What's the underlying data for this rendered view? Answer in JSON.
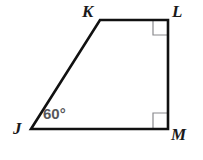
{
  "figure": {
    "kind": "quadrilateral-diagram",
    "shape_name": "JKLM",
    "background_color": "#ffffff",
    "stroke_color": "#111111",
    "stroke_width": 2.6,
    "right_angle_mark_color": "#8a8a8e",
    "right_angle_mark_width": 1.2,
    "angle_label_color": "#57575a",
    "vertex_label_color": "#1a1a1a",
    "vertices": [
      {
        "name": "J",
        "x": 31,
        "y": 129,
        "label": "J",
        "label_x": 13,
        "label_y": 120
      },
      {
        "name": "K",
        "x": 100,
        "y": 20,
        "label": "K",
        "label_x": 82,
        "label_y": 3
      },
      {
        "name": "L",
        "x": 168,
        "y": 20,
        "label": "L",
        "label_x": 172,
        "label_y": 3
      },
      {
        "name": "M",
        "x": 168,
        "y": 129,
        "label": "M",
        "label_x": 171,
        "label_y": 126
      }
    ],
    "edges": [
      {
        "name": "JK",
        "from": "J",
        "to": "K"
      },
      {
        "name": "KL",
        "from": "K",
        "to": "L"
      },
      {
        "name": "LM",
        "from": "L",
        "to": "M"
      },
      {
        "name": "MJ",
        "from": "M",
        "to": "J"
      }
    ],
    "angle_labels": [
      {
        "at_vertex": "J",
        "text": "60°",
        "x": 43,
        "y": 106
      }
    ],
    "right_angle_marks": [
      {
        "at_vertex": "L",
        "x": 153,
        "y": 21,
        "size": 14
      },
      {
        "at_vertex": "M",
        "x": 153,
        "y": 113,
        "size": 14
      }
    ],
    "polygon_points": "31,129 100,20 168,20 168,129"
  }
}
